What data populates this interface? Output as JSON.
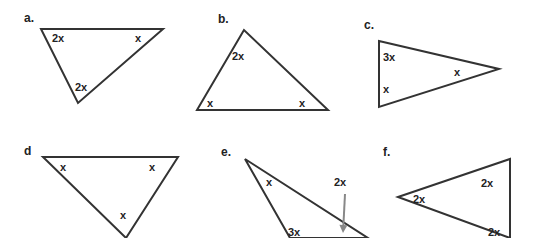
{
  "diagram": {
    "colors": {
      "line": "#333333",
      "text": "#222222",
      "arrow": "#888888",
      "background": "#ffffff"
    },
    "triangles": [
      {
        "id": "a",
        "label": "a.",
        "label_pos": [
          24,
          22
        ],
        "vertices": [
          [
            41,
            29
          ],
          [
            163,
            29
          ],
          [
            78,
            103
          ]
        ],
        "angles": [
          {
            "text": "2x",
            "pos": [
              52,
              42
            ]
          },
          {
            "text": "x",
            "pos": [
              135,
              42
            ]
          },
          {
            "text": "2x",
            "pos": [
              75,
              91
            ]
          }
        ]
      },
      {
        "id": "b",
        "label": "b.",
        "label_pos": [
          218,
          23
        ],
        "vertices": [
          [
            244,
            30
          ],
          [
            197,
            110
          ],
          [
            328,
            110
          ]
        ],
        "angles": [
          {
            "text": "2x",
            "pos": [
              232,
              60
            ]
          },
          {
            "text": "x",
            "pos": [
              207,
              107
            ]
          },
          {
            "text": "x",
            "pos": [
              299,
              107
            ]
          }
        ]
      },
      {
        "id": "c",
        "label": "c.",
        "label_pos": [
          364,
          29
        ],
        "vertices": [
          [
            379,
            41
          ],
          [
            499,
            69
          ],
          [
            379,
            107
          ]
        ],
        "angles": [
          {
            "text": "3x",
            "pos": [
              383,
              61
            ]
          },
          {
            "text": "x",
            "pos": [
              454,
              76
            ]
          },
          {
            "text": "x",
            "pos": [
              383,
              93
            ]
          }
        ]
      },
      {
        "id": "d",
        "label": "d",
        "label_pos": [
          24,
          155
        ],
        "vertices": [
          [
            43,
            157
          ],
          [
            178,
            157
          ],
          [
            126,
            238
          ]
        ],
        "angles": [
          {
            "text": "x",
            "pos": [
              60,
              171
            ]
          },
          {
            "text": "x",
            "pos": [
              149,
              171
            ]
          },
          {
            "text": "x",
            "pos": [
              120,
              219
            ]
          }
        ]
      },
      {
        "id": "e",
        "label": "e.",
        "label_pos": [
          221,
          156
        ],
        "vertices": [
          [
            245,
            159
          ],
          [
            290,
            238
          ],
          [
            368,
            238
          ]
        ],
        "angles": [
          {
            "text": "x",
            "pos": [
              266,
              186
            ]
          },
          {
            "text": "2x",
            "pos": [
              334,
              186
            ]
          },
          {
            "text": "3x",
            "pos": [
              288,
              236
            ]
          }
        ],
        "arrow": {
          "from": [
            345,
            194
          ],
          "to": [
            343,
            233
          ]
        }
      },
      {
        "id": "f",
        "label": "f.",
        "label_pos": [
          383,
          156
        ],
        "vertices": [
          [
            398,
            197
          ],
          [
            510,
            159
          ],
          [
            510,
            238
          ]
        ],
        "angles": [
          {
            "text": "2x",
            "pos": [
              413,
              203
            ]
          },
          {
            "text": "2x",
            "pos": [
              481,
              187
            ]
          },
          {
            "text": "2x",
            "pos": [
              488,
              236
            ]
          }
        ]
      }
    ]
  }
}
